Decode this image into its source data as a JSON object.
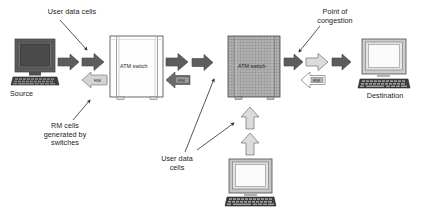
{
  "diagram": {
    "background_color": "#ffffff",
    "labels": {
      "user_data_cells_top": "User data cells",
      "rm_cells_generated": "RM cells\ngenerated by\nswitches",
      "source": "Source",
      "point_of_congestion": "Point of\ncongestion",
      "destination": "Destination",
      "user_data_cells_bottom": "User data\ncells"
    },
    "nodes": [
      {
        "id": "source-computer",
        "type": "computer",
        "label": "Source",
        "screen_style": "dark"
      },
      {
        "id": "atm-switch-1",
        "type": "switch",
        "label": "ATM switch",
        "state": "normal"
      },
      {
        "id": "atm-switch-2",
        "type": "switch",
        "label": "ATM switch",
        "state": "congested"
      },
      {
        "id": "destination-computer",
        "type": "computer",
        "label": "Destination",
        "screen_style": "light"
      },
      {
        "id": "second-source-computer",
        "type": "computer",
        "label": "",
        "screen_style": "light"
      }
    ],
    "flows": [
      {
        "id": "data-src-to-sw1-a",
        "kind": "user-data",
        "direction": "right",
        "fill": "dark"
      },
      {
        "id": "data-src-to-sw1-b",
        "kind": "user-data",
        "direction": "right",
        "fill": "dark"
      },
      {
        "id": "rm-sw1-to-src",
        "kind": "rm-cell",
        "direction": "left",
        "fill": "light",
        "tag": "RM"
      },
      {
        "id": "data-sw1-to-sw2-a",
        "kind": "user-data",
        "direction": "right",
        "fill": "dark"
      },
      {
        "id": "data-sw1-to-sw2-b",
        "kind": "user-data",
        "direction": "right",
        "fill": "dark"
      },
      {
        "id": "rm-sw2-to-sw1",
        "kind": "rm-cell",
        "direction": "left",
        "fill": "dark",
        "tag": "RM"
      },
      {
        "id": "data-sw2-to-dest-a",
        "kind": "user-data",
        "direction": "right",
        "fill": "dark"
      },
      {
        "id": "data-sw2-to-dest-b",
        "kind": "user-data",
        "direction": "right",
        "fill": "light"
      },
      {
        "id": "data-sw2-to-dest-c",
        "kind": "user-data",
        "direction": "right",
        "fill": "dark"
      },
      {
        "id": "rm-dest-to-sw2",
        "kind": "rm-cell",
        "direction": "left",
        "fill": "outline",
        "tag": "RM"
      },
      {
        "id": "data-pc2-to-sw2-a",
        "kind": "user-data",
        "direction": "up",
        "fill": "light"
      },
      {
        "id": "data-pc2-to-sw2-b",
        "kind": "user-data",
        "direction": "up",
        "fill": "light"
      }
    ],
    "rm_tag_text": "RM",
    "switch_label_text": "ATM switch",
    "colors": {
      "arrow_dark": "#5d5d5d",
      "arrow_light": "#d3d3d3",
      "arrow_outline_fill": "#ffffff",
      "switch_normal_fill": "#fefefe",
      "switch_congested_fill": "#a8a8a8",
      "monitor_dark": "#5a5a5a",
      "monitor_light": "#c9c9c9",
      "line": "#2b2b2b",
      "text": "#1a1a1a"
    }
  }
}
